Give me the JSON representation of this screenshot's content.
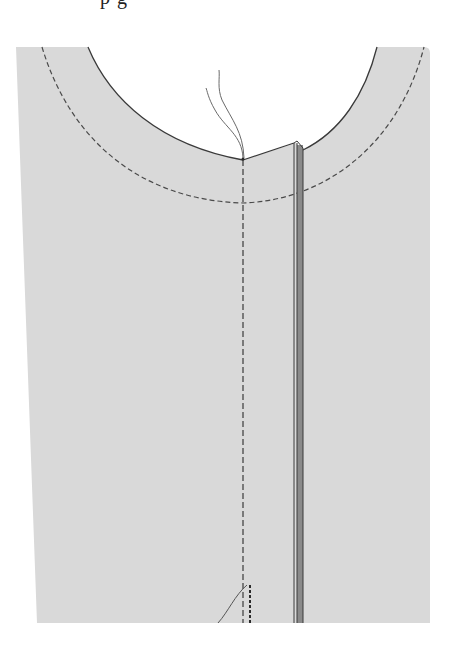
{
  "figure": {
    "caption_fragment": "p  g",
    "colors": {
      "fabric": "#d9d9d9",
      "outline": "#3a3a3a",
      "stitch": "#4a4a4a",
      "placket": "#8a8a8a",
      "thread": "#6a6a6a",
      "background": "#ffffff"
    },
    "elements": [
      "fabric-panel",
      "neckline-edge",
      "neckline-stitching-line",
      "center-front-stitching-line",
      "front-placket",
      "loose-thread-ends",
      "thread-tail-bottom"
    ]
  }
}
